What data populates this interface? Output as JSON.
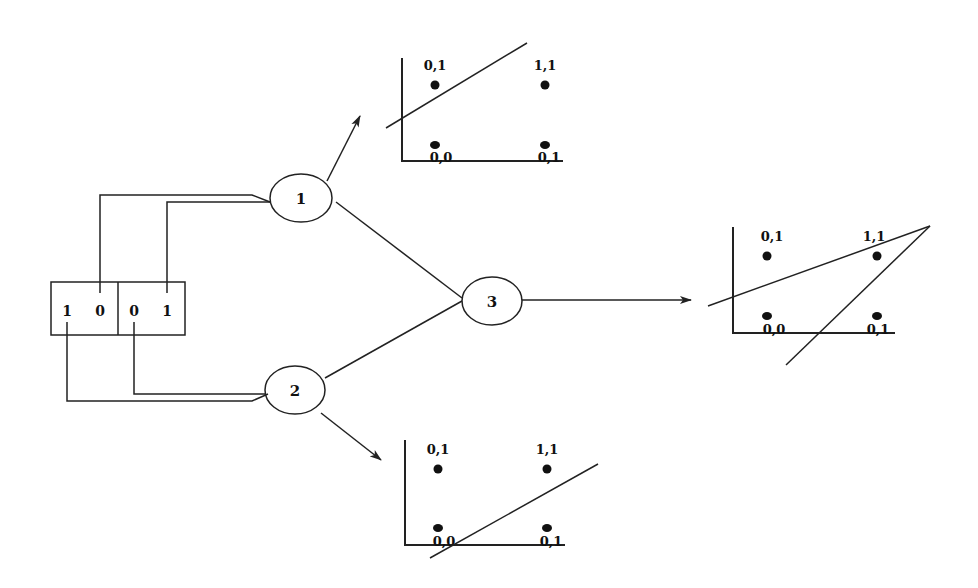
{
  "diagram": {
    "input_box": {
      "pattern_a": [
        "1",
        "0"
      ],
      "pattern_b": [
        "0",
        "1"
      ]
    },
    "nodes": [
      {
        "id": "1",
        "label": "1",
        "role": "hidden"
      },
      {
        "id": "2",
        "label": "2",
        "role": "hidden"
      },
      {
        "id": "3",
        "label": "3",
        "role": "output"
      }
    ],
    "plots": {
      "top": {
        "attached_to": "1",
        "points": [
          {
            "label": "0,1",
            "pos": "upper-left"
          },
          {
            "label": "1,1",
            "pos": "upper-right"
          },
          {
            "label": "0,0",
            "pos": "lower-left"
          },
          {
            "label": "0,1",
            "pos": "lower-right"
          }
        ],
        "boundary_lines": 1
      },
      "bottom": {
        "attached_to": "2",
        "points": [
          {
            "label": "0,1",
            "pos": "upper-left"
          },
          {
            "label": "1,1",
            "pos": "upper-right"
          },
          {
            "label": "0,0",
            "pos": "lower-left"
          },
          {
            "label": "0,1",
            "pos": "lower-right"
          }
        ],
        "boundary_lines": 1
      },
      "right": {
        "attached_to": "3",
        "points": [
          {
            "label": "0,1",
            "pos": "upper-left"
          },
          {
            "label": "1,1",
            "pos": "upper-right"
          },
          {
            "label": "0,0",
            "pos": "lower-left"
          },
          {
            "label": "0,1",
            "pos": "lower-right"
          }
        ],
        "boundary_lines": 2
      }
    },
    "colors": {
      "ink": "#222222",
      "background": "#ffffff"
    }
  }
}
